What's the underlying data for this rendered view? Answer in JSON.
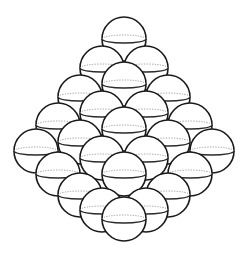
{
  "figure": {
    "sphere_radius": 22,
    "equator_ry": 4,
    "stroke_color": "#1a1a1a",
    "fill_color": "#ffffff",
    "dotted_color": "#9a9a9a",
    "spheres": [
      {
        "x": 124,
        "y": 39
      },
      {
        "x": 102,
        "y": 68
      },
      {
        "x": 146,
        "y": 68
      },
      {
        "x": 80,
        "y": 97
      },
      {
        "x": 168,
        "y": 97
      },
      {
        "x": 124,
        "y": 84
      },
      {
        "x": 58,
        "y": 125
      },
      {
        "x": 190,
        "y": 125
      },
      {
        "x": 102,
        "y": 113
      },
      {
        "x": 146,
        "y": 113
      },
      {
        "x": 36,
        "y": 151
      },
      {
        "x": 212,
        "y": 151
      },
      {
        "x": 80,
        "y": 142
      },
      {
        "x": 168,
        "y": 142
      },
      {
        "x": 124,
        "y": 129
      },
      {
        "x": 58,
        "y": 174
      },
      {
        "x": 190,
        "y": 174
      },
      {
        "x": 102,
        "y": 158
      },
      {
        "x": 146,
        "y": 158
      },
      {
        "x": 80,
        "y": 195
      },
      {
        "x": 168,
        "y": 195
      },
      {
        "x": 124,
        "y": 174
      },
      {
        "x": 102,
        "y": 210
      },
      {
        "x": 146,
        "y": 210
      },
      {
        "x": 124,
        "y": 219
      }
    ]
  }
}
